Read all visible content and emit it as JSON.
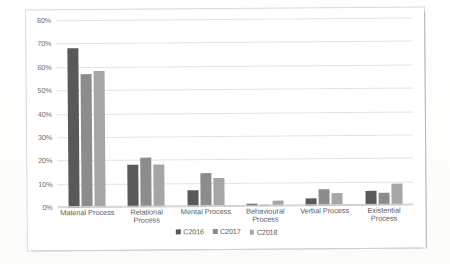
{
  "chart_data": {
    "type": "bar",
    "title": "",
    "xlabel": "",
    "ylabel": "",
    "ylim": [
      0,
      80
    ],
    "ytick_labels": [
      "0%",
      "10%",
      "20%",
      "30%",
      "40%",
      "50%",
      "60%",
      "70%",
      "80%"
    ],
    "ytick_values": [
      0,
      10,
      20,
      30,
      40,
      50,
      60,
      70,
      80
    ],
    "grid": true,
    "legend_position": "bottom",
    "categories": [
      "Material Process",
      "Relational Process",
      "Mental Process",
      "Behavioural Process",
      "Verbal Process",
      "Existential Process"
    ],
    "series": [
      {
        "name": "C2016",
        "color": "#595959",
        "values": [
          68,
          18,
          7,
          1,
          3,
          6
        ]
      },
      {
        "name": "C2017",
        "color": "#8c8c8c",
        "values": [
          57,
          21,
          14,
          0,
          7,
          5
        ]
      },
      {
        "name": "C2018",
        "color": "#a6a6a6",
        "values": [
          58,
          18,
          12,
          2,
          5,
          9
        ]
      }
    ]
  }
}
